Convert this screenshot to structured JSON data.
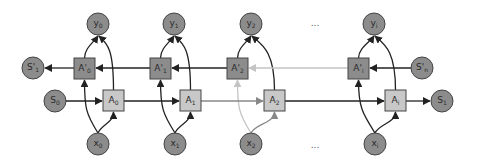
{
  "diagram": {
    "type": "bidirectional-rnn-unrolled",
    "colors": {
      "circle_fill": "#8c8c8c",
      "backward_box_fill": "#8c8c8c",
      "forward_box_fill": "#c8c8c8",
      "stroke": "#444444",
      "edge_dark": "#222222",
      "edge_mid": "#888888",
      "edge_light": "#c4c4c4"
    },
    "columns": [
      {
        "output": {
          "base": "y",
          "sub": "0",
          "cx": 98,
          "cy": 24
        },
        "backward": {
          "base": "A'",
          "sub": "0",
          "x": 74,
          "y": 58
        },
        "forward": {
          "base": "A",
          "sub": "0",
          "x": 103,
          "y": 90
        },
        "input": {
          "base": "x",
          "sub": "0",
          "cx": 98,
          "cy": 144
        }
      },
      {
        "output": {
          "base": "y",
          "sub": "1",
          "cx": 174,
          "cy": 24
        },
        "backward": {
          "base": "A'",
          "sub": "1",
          "x": 150,
          "y": 58
        },
        "forward": {
          "base": "A",
          "sub": "1",
          "x": 180,
          "y": 90
        },
        "input": {
          "base": "x",
          "sub": "1",
          "cx": 175,
          "cy": 144
        }
      },
      {
        "output": {
          "base": "y",
          "sub": "2",
          "cx": 251,
          "cy": 24
        },
        "backward": {
          "base": "A'",
          "sub": "2",
          "x": 227,
          "y": 58
        },
        "forward": {
          "base": "A",
          "sub": "2",
          "x": 264,
          "y": 90
        },
        "input": {
          "base": "x",
          "sub": "2",
          "cx": 251,
          "cy": 144
        }
      },
      {
        "output": {
          "base": "y",
          "sub": "i",
          "cx": 374,
          "cy": 24
        },
        "backward": {
          "base": "A'",
          "sub": "i",
          "x": 348,
          "y": 58
        },
        "forward": {
          "base": "A",
          "sub": "i",
          "x": 385,
          "y": 90
        },
        "input": {
          "base": "x",
          "sub": "i",
          "cx": 375,
          "cy": 144
        }
      }
    ],
    "states": {
      "s_prime_out": {
        "base": "S'",
        "sub": "1",
        "cx": 33,
        "cy": 68
      },
      "s_in": {
        "base": "S",
        "sub": "0",
        "cx": 55,
        "cy": 101
      },
      "s_prime_in": {
        "base": "S'",
        "sub": "n",
        "cx": 422,
        "cy": 68
      },
      "s_out": {
        "base": "S",
        "sub": "1",
        "cx": 442,
        "cy": 101
      }
    },
    "ellipsis": [
      {
        "text": "...",
        "x": 315,
        "y": 26
      },
      {
        "text": "...",
        "x": 315,
        "y": 148
      }
    ]
  }
}
